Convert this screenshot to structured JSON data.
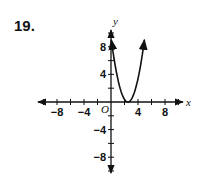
{
  "problem": {
    "number": "19."
  },
  "chart_data": {
    "type": "line",
    "title": "",
    "xlabel": "x",
    "ylabel": "y",
    "origin_label": "O",
    "xlim": [
      -10,
      10
    ],
    "ylim": [
      -10,
      10
    ],
    "x_ticks": [
      -8,
      -4,
      4,
      8
    ],
    "y_ticks": [
      8,
      4,
      -4,
      -8
    ],
    "x_tick_labels": [
      "−8",
      "−4",
      "4",
      "8"
    ],
    "y_tick_labels": [
      "8",
      "4",
      "−4",
      "−8"
    ],
    "grid": false,
    "series": [
      {
        "name": "parabola",
        "description": "upward-opening parabola with vertex on the x-axis",
        "vertex": [
          2.5,
          0
        ],
        "x": [
          0,
          0.5,
          1,
          1.5,
          2,
          2.5,
          3,
          3.5,
          4,
          4.5,
          5,
          5.3
        ],
        "y": [
          9.5,
          6.1,
          3.4,
          1.5,
          0.4,
          0,
          0.4,
          1.5,
          3.4,
          6.1,
          9.5,
          11.4
        ]
      }
    ]
  }
}
